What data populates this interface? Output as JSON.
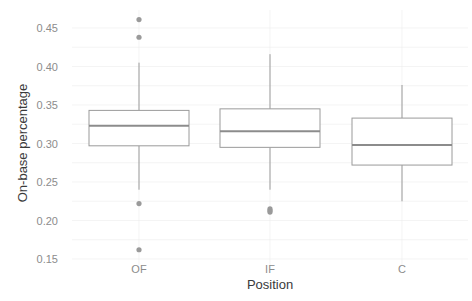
{
  "chart_data": {
    "type": "boxplot",
    "title": "",
    "xlabel": "Position",
    "ylabel": "On-base percentage",
    "ylim": [
      0.15,
      0.46
    ],
    "yticks": [
      "0.15",
      "0.20",
      "0.25",
      "0.30",
      "0.35",
      "0.40",
      "0.45"
    ],
    "grid": true,
    "categories": [
      "OF",
      "IF",
      "C"
    ],
    "boxes": [
      {
        "name": "OF",
        "whisker_low": 0.24,
        "q1": 0.297,
        "median": 0.323,
        "q3": 0.343,
        "whisker_high": 0.405,
        "outliers": [
          0.461,
          0.438,
          0.222,
          0.162
        ]
      },
      {
        "name": "IF",
        "whisker_low": 0.24,
        "q1": 0.295,
        "median": 0.316,
        "q3": 0.345,
        "whisker_high": 0.416,
        "outliers": [
          0.215,
          0.213,
          0.211
        ]
      },
      {
        "name": "C",
        "whisker_low": 0.225,
        "q1": 0.272,
        "median": 0.298,
        "q3": 0.333,
        "whisker_high": 0.376,
        "outliers": []
      }
    ],
    "colors": {
      "box": "#9a9a9a",
      "median": "#8c8c8c",
      "outlier": "#9a9a9a",
      "grid": "#ececec",
      "text": "#8c8c8c"
    }
  }
}
